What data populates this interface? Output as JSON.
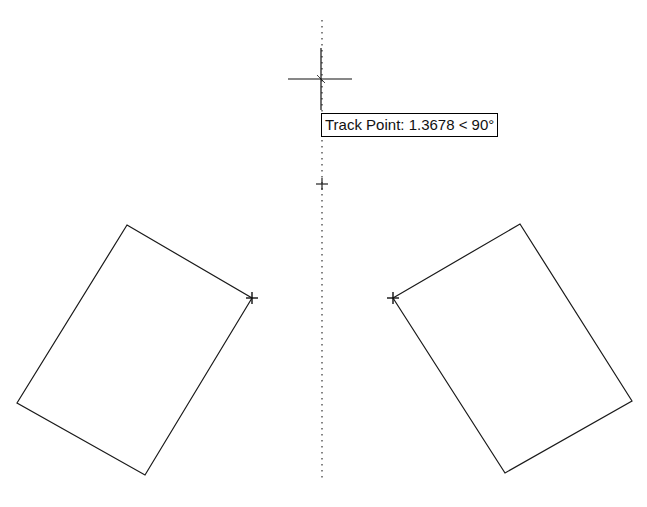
{
  "viewport": {
    "width": 647,
    "height": 507,
    "background": "#ffffff"
  },
  "tooltip": {
    "label": "Track Point:",
    "distance": "1.3678",
    "angle": "< 90°",
    "text": "Track Point: 1.3678 < 90°"
  },
  "colors": {
    "stroke": "#1a1a1a",
    "tracking_line": "#333333"
  },
  "tracking_line": {
    "x": 322,
    "y_start": 20,
    "y_end": 480,
    "style": "dotted"
  },
  "cursor": {
    "x": 321,
    "y": 79,
    "arm_horizontal": 32,
    "vertical_top": 48,
    "vertical_bottom": 110
  },
  "track_point_marker": {
    "x": 322,
    "y": 184
  },
  "shapes": [
    {
      "name": "left-rectangle",
      "points": [
        [
          127,
          225
        ],
        [
          252,
          298
        ],
        [
          145,
          475
        ],
        [
          17,
          403
        ]
      ],
      "snap_marker": [
        252,
        298
      ]
    },
    {
      "name": "right-rectangle",
      "points": [
        [
          393,
          298
        ],
        [
          520,
          224
        ],
        [
          632,
          401
        ],
        [
          505,
          473
        ]
      ],
      "snap_marker": [
        393,
        298
      ]
    }
  ]
}
